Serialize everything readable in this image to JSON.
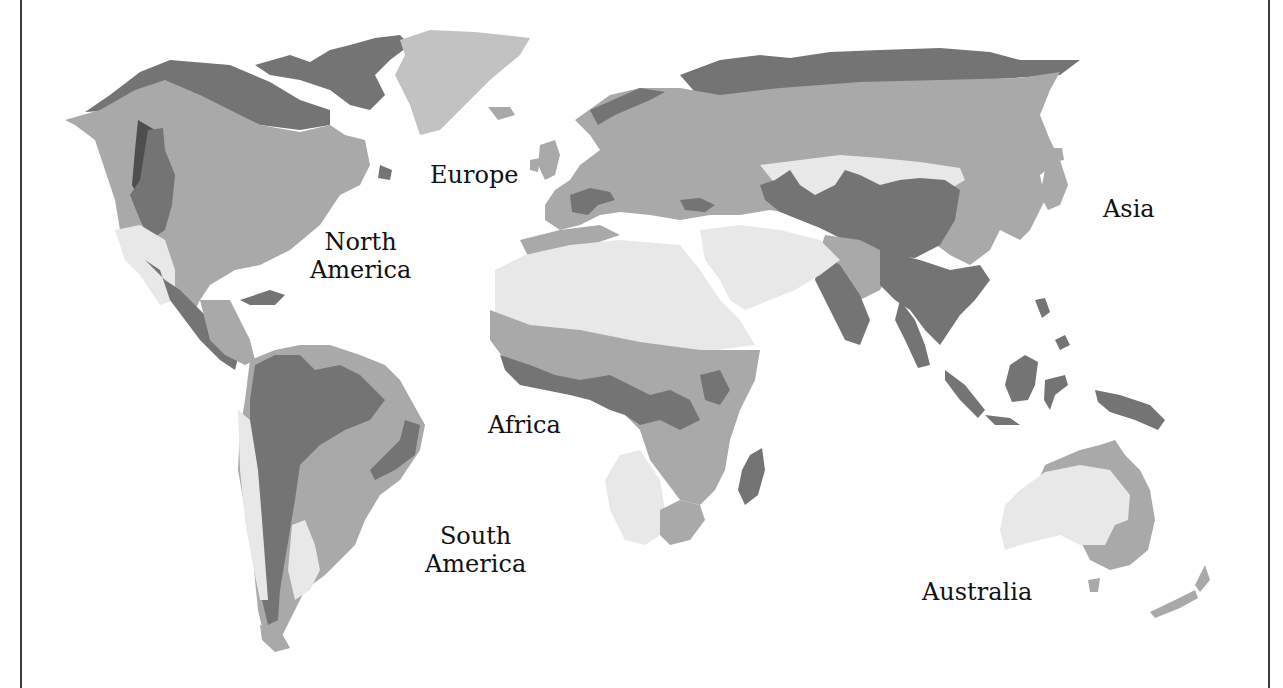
{
  "map": {
    "type": "world climate/biome zones (greyscale)",
    "shades": {
      "lightest": "#e8e8e8",
      "light": "#cfcfcf",
      "medium": "#a9a9a9",
      "dark": "#747474",
      "darkest": "#4e4e4e"
    },
    "labels": {
      "north_america_1": "North",
      "north_america_2": "America",
      "europe": "Europe",
      "asia": "Asia",
      "africa": "Africa",
      "south_america_1": "South",
      "south_america_2": "America",
      "australia": "Australia"
    }
  }
}
